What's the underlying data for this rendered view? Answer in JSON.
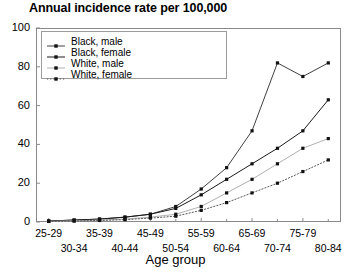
{
  "chart_data": {
    "type": "line",
    "title": "Annual incidence rate per 100,000",
    "xlabel": "Age group",
    "ylabel": "",
    "ylim": [
      0,
      100
    ],
    "yticks": [
      0,
      20,
      40,
      60,
      80,
      100
    ],
    "grid": false,
    "legend_position": "top-left inside plot",
    "categories": [
      "25-29",
      "30-34",
      "35-39",
      "40-44",
      "45-49",
      "50-54",
      "55-59",
      "60-64",
      "65-69",
      "70-74",
      "75-79",
      "80-84"
    ],
    "series": [
      {
        "name": "Black, male",
        "marker": "square",
        "linestyle": "solid",
        "color": "#404040",
        "values": [
          0.5,
          1,
          1.5,
          2.5,
          4,
          8,
          17,
          28,
          47,
          82,
          75,
          82
        ]
      },
      {
        "name": "Black, female",
        "marker": "square",
        "linestyle": "solid",
        "color": "#1a1a1a",
        "values": [
          0.5,
          1,
          1.5,
          2.5,
          4,
          7,
          14,
          22,
          30,
          38,
          47,
          63
        ]
      },
      {
        "name": "White, male",
        "marker": "square",
        "linestyle": "solid",
        "color": "#b0b0b0",
        "values": [
          0.3,
          0.6,
          1,
          1.5,
          2.5,
          4,
          8,
          15,
          22,
          30,
          38,
          43
        ]
      },
      {
        "name": "White, female",
        "marker": "square",
        "linestyle": "dotted",
        "color": "#555555",
        "values": [
          0.3,
          0.5,
          0.8,
          1.2,
          2,
          3,
          6,
          10,
          15,
          20,
          26,
          32
        ]
      }
    ]
  },
  "legend": {
    "items": [
      {
        "label": "Black, male"
      },
      {
        "label": "Black, female"
      },
      {
        "label": "White, male"
      },
      {
        "label": "White, female"
      }
    ]
  },
  "axes": {
    "y_tick_labels": [
      "100",
      "80",
      "60",
      "40",
      "20",
      "0"
    ],
    "x_tick_labels_top": [
      "25-29",
      "35-39",
      "45-49",
      "55-59",
      "65-69",
      "75-79"
    ],
    "x_tick_labels_bottom": [
      "30-34",
      "40-44",
      "50-54",
      "60-64",
      "70-74",
      "80-84"
    ]
  }
}
